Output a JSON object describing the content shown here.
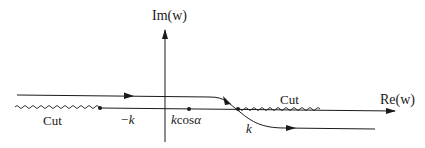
{
  "diagram": {
    "type": "complex-plane contour",
    "axes": {
      "imag_label": "Im(w)",
      "real_label": "Re(w)"
    },
    "points": [
      {
        "name": "minus-k",
        "label": "−k"
      },
      {
        "name": "k-cos-alpha",
        "label_k": "k",
        "label_cos": "cos",
        "label_alpha": "α"
      },
      {
        "name": "k",
        "label": "k"
      }
    ],
    "cuts": [
      {
        "name": "left-cut",
        "label": "Cut"
      },
      {
        "name": "right-cut",
        "label": "Cut"
      }
    ],
    "colors": {
      "stroke": "#1a1a1a",
      "background": "#ffffff"
    }
  }
}
